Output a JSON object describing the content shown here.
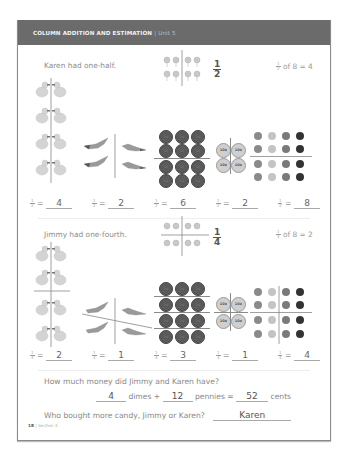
{
  "header": {
    "title": "COLUMN ADDITION AND ESTIMATION",
    "separator": "|",
    "unit": "Unit 5"
  },
  "section1": {
    "story": "Karen had one-half.",
    "fraction": {
      "numerator": "1",
      "denominator": "2"
    },
    "fraction_of": {
      "numerator": "1",
      "denominator": "2",
      "text": "of 8 = 4"
    },
    "coin_label": "1¢",
    "dime_label": "10¢",
    "answers": [
      {
        "numerator": "1",
        "denominator": "2",
        "eq": "=",
        "value": "4"
      },
      {
        "numerator": "1",
        "denominator": "2",
        "eq": "=",
        "value": "2"
      },
      {
        "numerator": "1",
        "denominator": "2",
        "eq": "=",
        "value": "6"
      },
      {
        "numerator": "1",
        "denominator": "2",
        "eq": "=",
        "value": "2"
      },
      {
        "numerator": "1",
        "denominator": "2",
        "eq": "=",
        "value": "8"
      }
    ]
  },
  "section2": {
    "story": "Jimmy had one-fourth.",
    "fraction": {
      "numerator": "1",
      "denominator": "4"
    },
    "fraction_of": {
      "numerator": "1",
      "denominator": "4",
      "text": "of 8 = 2"
    },
    "coin_label": "1¢",
    "dime_label": "10¢",
    "answers": [
      {
        "numerator": "1",
        "denominator": "4",
        "eq": "=",
        "value": "2"
      },
      {
        "numerator": "1",
        "denominator": "4",
        "eq": "=",
        "value": "1"
      },
      {
        "numerator": "1",
        "denominator": "4",
        "eq": "=",
        "value": "3"
      },
      {
        "numerator": "1",
        "denominator": "4",
        "eq": "=",
        "value": "1"
      },
      {
        "numerator": "1",
        "denominator": "4",
        "eq": "=",
        "value": "4"
      }
    ]
  },
  "questions": {
    "q1": "How much money did Jimmy and Karen have?",
    "dimes_value": "4",
    "dimes_label": "dimes +",
    "pennies_value": "12",
    "pennies_label": "pennies =",
    "cents_value": "52",
    "cents_label": "cents",
    "q2": "Who bought more candy, Jimmy or Karen?",
    "q2_answer": "Karen"
  },
  "footer": {
    "page_number": "18",
    "separator": "|",
    "section": "Section 3"
  }
}
